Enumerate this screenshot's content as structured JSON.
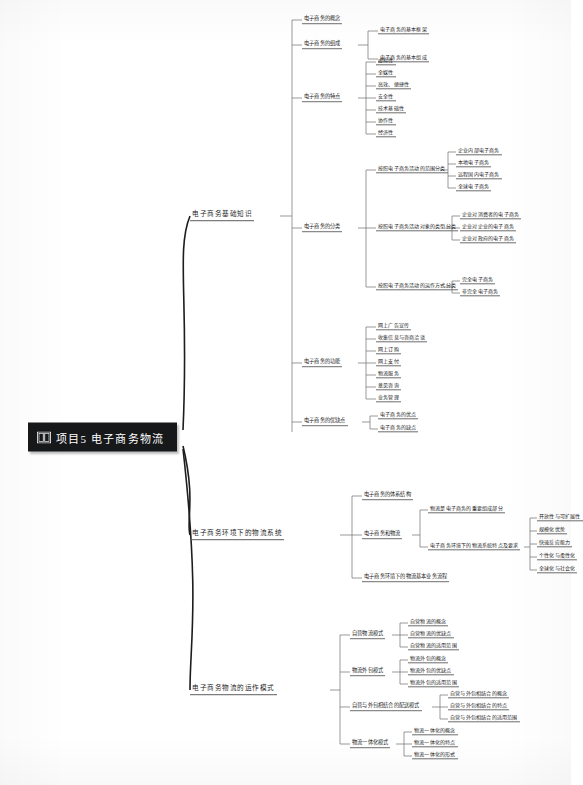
{
  "root": {
    "icon": "open-book-icon",
    "label": "项目5   电子商务物流"
  },
  "branches": [
    {
      "id": "b1",
      "label": "电子商务基础知识",
      "children": [
        {
          "label": "电子商务的概念",
          "children": []
        },
        {
          "label": "电子商务的组成",
          "children": [
            {
              "label": "电子商务的基本框架"
            },
            {
              "label": "电子商务的基本组成"
            }
          ]
        },
        {
          "label": "电子商务的特点",
          "children": [
            {
              "label": "虚拟性"
            },
            {
              "label": "全媒性"
            },
            {
              "label": "高效、便捷性"
            },
            {
              "label": "安全性"
            },
            {
              "label": "技术基础性"
            },
            {
              "label": "协作性"
            },
            {
              "label": "经济性"
            }
          ]
        },
        {
          "label": "电子商务的分类",
          "children": [
            {
              "label": "按照电子商务活动的范围分类",
              "children": [
                {
                  "label": "企业内部电子商务"
                },
                {
                  "label": "本地电子商务"
                },
                {
                  "label": "远程国内电子商务"
                },
                {
                  "label": "全球电子商务"
                }
              ]
            },
            {
              "label": "按照电子商务活动对象的类型分类",
              "children": [
                {
                  "label": "企业对消费者的电子商务"
                },
                {
                  "label": "企业对企业的电子商务"
                },
                {
                  "label": "企业对政府的电子商务"
                }
              ]
            },
            {
              "label": "按照电子商务活动的运作方式分类",
              "children": [
                {
                  "label": "完全电子商务"
                },
                {
                  "label": "非完全电子商务"
                }
              ]
            }
          ]
        },
        {
          "label": "电子商务的功能",
          "children": [
            {
              "label": "网上广告宣传"
            },
            {
              "label": "收集信息与咨商洽谈"
            },
            {
              "label": "网上订购"
            },
            {
              "label": "网上支付"
            },
            {
              "label": "物流服务"
            },
            {
              "label": "意见咨询"
            },
            {
              "label": "业务管理"
            }
          ]
        },
        {
          "label": "电子商务的优缺点",
          "children": [
            {
              "label": "电子商务的优点"
            },
            {
              "label": "电子商务的缺点"
            }
          ]
        }
      ]
    },
    {
      "id": "b2",
      "label": "电子商务环境下的物流系统",
      "children": [
        {
          "label": "电子商务的体系结构",
          "children": []
        },
        {
          "label": "电子商务和物流",
          "children": [
            {
              "label": "物流是电子商务的重要组成部分"
            },
            {
              "label": "电子商务环境下的物流系统特点及要求",
              "children": [
                {
                  "label": "开放性与可扩展性"
                },
                {
                  "label": "规模化优势"
                },
                {
                  "label": "快速反应能力"
                },
                {
                  "label": "个性化与柔性化"
                },
                {
                  "label": "全球化与社会化"
                }
              ]
            }
          ]
        },
        {
          "label": "电子商务环境下的物流基本业务流程",
          "children": []
        }
      ]
    },
    {
      "id": "b3",
      "label": "电子商务物流的运作模式",
      "children": [
        {
          "label": "自营物流模式",
          "children": [
            {
              "label": "自营物流的概念"
            },
            {
              "label": "自营物流的优缺点"
            },
            {
              "label": "自营物流的适用范围"
            }
          ]
        },
        {
          "label": "物流外包模式",
          "children": [
            {
              "label": "物流外包的概念"
            },
            {
              "label": "物流外包的优缺点"
            },
            {
              "label": "物流外包的适用范围"
            }
          ]
        },
        {
          "label": "自营与外包相结合的配送模式",
          "children": [
            {
              "label": "自营与外包相结合的概念"
            },
            {
              "label": "自营与外包相结合的特点"
            },
            {
              "label": "自营与外包相结合的适用范围"
            }
          ]
        },
        {
          "label": "物流一体化模式",
          "children": [
            {
              "label": "物流一体化的概念"
            },
            {
              "label": "物流一体化的特点"
            },
            {
              "label": "物流一体化的形式"
            }
          ]
        }
      ]
    }
  ],
  "colors": {
    "root_bg": "#17181a",
    "root_text": "#ffffff",
    "line": "#6e6e6e",
    "text": "#1d1d1d",
    "page_bg": "#ffffff"
  }
}
